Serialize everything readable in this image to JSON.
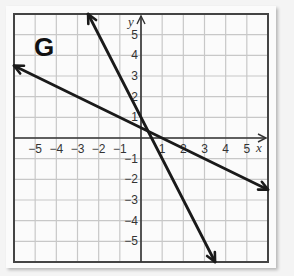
{
  "chart_data": {
    "type": "line",
    "title": "",
    "panel_label": "G",
    "xlabel": "x",
    "ylabel": "y",
    "xlim": [
      -6,
      6
    ],
    "ylim": [
      -6,
      6
    ],
    "grid": true,
    "x_ticks": [
      "-5",
      "-4",
      "-3",
      "-2",
      "-1",
      "1",
      "2",
      "3",
      "4",
      "5"
    ],
    "y_ticks": [
      "5",
      "4",
      "3",
      "2",
      "1",
      "-1",
      "-2",
      "-3",
      "-4",
      "-5"
    ],
    "series": [
      {
        "name": "steep line",
        "slope": -2,
        "intercept": 1,
        "points": [
          [
            -2.5,
            6
          ],
          [
            3.5,
            -6
          ]
        ],
        "arrows": "both"
      },
      {
        "name": "shallow line",
        "slope": -0.5,
        "intercept": 0.5,
        "points": [
          [
            -6,
            3.5
          ],
          [
            6,
            -2.5
          ]
        ],
        "arrows": "both"
      }
    ],
    "colors": {
      "line": "#1a1a1a",
      "grid": "#c8c8c8",
      "frame": "#444444"
    }
  }
}
